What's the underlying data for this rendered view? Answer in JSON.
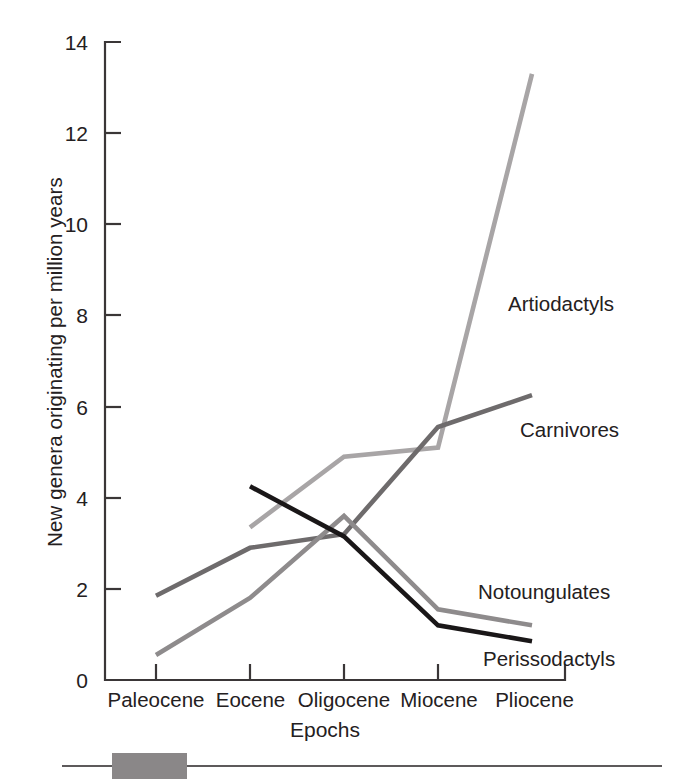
{
  "chart_data": {
    "type": "line",
    "title": "",
    "xlabel": "Epochs",
    "ylabel": "New genera originating per million years",
    "categories": [
      "Paleocene",
      "Eocene",
      "Oligocene",
      "Miocene",
      "Pliocene"
    ],
    "ylim": [
      0,
      14
    ],
    "yticks": [
      0,
      2,
      4,
      6,
      8,
      10,
      12,
      14
    ],
    "ytick_labels": [
      "0",
      "2",
      "4",
      "6",
      "8",
      "10",
      "12",
      "14"
    ],
    "grid": false,
    "legend_position": "inline-annotations",
    "series": [
      {
        "name": "Artiodactyls",
        "color": "#a8a5a6",
        "values": [
          null,
          3.35,
          4.9,
          5.1,
          13.3
        ]
      },
      {
        "name": "Carnivores",
        "color": "#6e6b6c",
        "values": [
          1.85,
          2.9,
          3.2,
          5.55,
          6.25
        ]
      },
      {
        "name": "Notoungulates",
        "color": "#8e8b8c",
        "values": [
          0.55,
          1.8,
          3.6,
          1.55,
          1.2
        ]
      },
      {
        "name": "Perissodactyls",
        "color": "#1a1718",
        "values": [
          null,
          4.25,
          3.15,
          1.2,
          0.85
        ]
      }
    ],
    "annotations": [
      {
        "text": "Artiodactyls",
        "x": 508,
        "y": 306
      },
      {
        "text": "Carnivores",
        "x": 520,
        "y": 432
      },
      {
        "text": "Notoungulates",
        "x": 478,
        "y": 594
      },
      {
        "text": "Perissodactyls",
        "x": 483,
        "y": 661
      }
    ]
  },
  "axes": {
    "y_tick_labels": [
      "14",
      "12",
      "10",
      "8",
      "6",
      "4",
      "2",
      "0"
    ],
    "x_tick_labels": [
      "Paleocene",
      "Eocene",
      "Oligocene",
      "Miocene",
      "Pliocene"
    ],
    "x_axis_title": "Epochs",
    "y_axis_title": "New genera originating per million years"
  },
  "colors": {
    "axis": "#3a3637",
    "text": "#242021",
    "artiodactyls": "#a8a5a6",
    "carnivores": "#6e6b6c",
    "notoungulates": "#8e8b8c",
    "perissodactyls": "#1a1718",
    "foot_rule": "#5d5a5b",
    "foot_block": "#8a8788",
    "background": "#ffffff"
  }
}
